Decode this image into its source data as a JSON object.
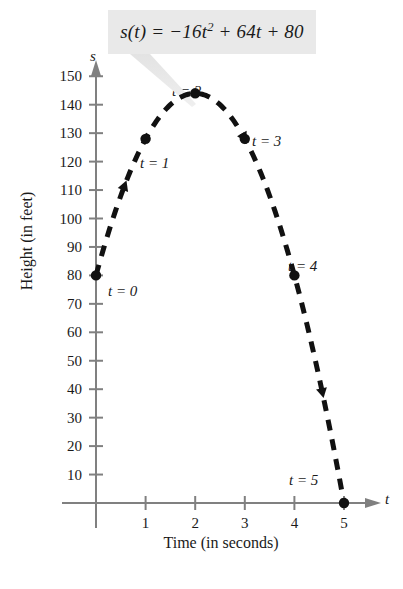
{
  "figure": {
    "formula": "s(t) = −16t² + 64t + 80",
    "formula_parts": {
      "lead": "s(t) = −16t",
      "exponent": "2",
      "tail": " + 64t + 80"
    },
    "axis_name_y": "s",
    "axis_name_x": "t",
    "background_color": "#ffffff",
    "formula_box_color": "#e9e9e9",
    "curve_color": "#111111",
    "axis_color": "#808080",
    "leader_color": "#dcdcdc"
  },
  "chart_data": {
    "type": "scatter",
    "title": "",
    "subtitle": "",
    "xlabel": "Time (in seconds)",
    "ylabel": "Height (in feet)",
    "axis_symbol_x": "t",
    "axis_symbol_y": "s",
    "equation": "s(t) = -16t^2 + 64t + 80",
    "equation_display": "s(t) = −16t² + 64t + 80",
    "x": [
      0,
      1,
      2,
      3,
      4,
      5
    ],
    "values": [
      80,
      128,
      144,
      128,
      80,
      0
    ],
    "point_labels": [
      "t = 0",
      "t = 1",
      "t = 2",
      "t = 3",
      "t = 4",
      "t = 5"
    ],
    "xlim": [
      0,
      5.6
    ],
    "ylim": [
      0,
      158
    ],
    "xticks": [
      1,
      2,
      3,
      4,
      5
    ],
    "xtick_labels": [
      "1",
      "2",
      "3",
      "4",
      "5"
    ],
    "yticks": [
      10,
      20,
      30,
      40,
      50,
      60,
      70,
      80,
      90,
      100,
      110,
      120,
      130,
      140,
      150
    ],
    "ytick_labels": [
      "10",
      "20",
      "30",
      "40",
      "50",
      "60",
      "70",
      "80",
      "90",
      "100",
      "110",
      "120",
      "130",
      "140",
      "150"
    ],
    "grid": false,
    "legend": "none",
    "line_style": "dashed",
    "marker": "filled-circle",
    "annotations": [
      {
        "text": "s(t) = −16t² + 64t + 80",
        "kind": "equation-callout"
      }
    ]
  },
  "point_label_positions": [
    {
      "label": "t = 0",
      "left": 108,
      "top": 283
    },
    {
      "label": "t = 1",
      "left": 140,
      "top": 155
    },
    {
      "label": "t = 2",
      "left": 172,
      "top": 83
    },
    {
      "label": "t = 3",
      "left": 252,
      "top": 133
    },
    {
      "label": "t = 4",
      "left": 288,
      "top": 258
    },
    {
      "label": "t = 5",
      "left": 289,
      "top": 472
    }
  ]
}
